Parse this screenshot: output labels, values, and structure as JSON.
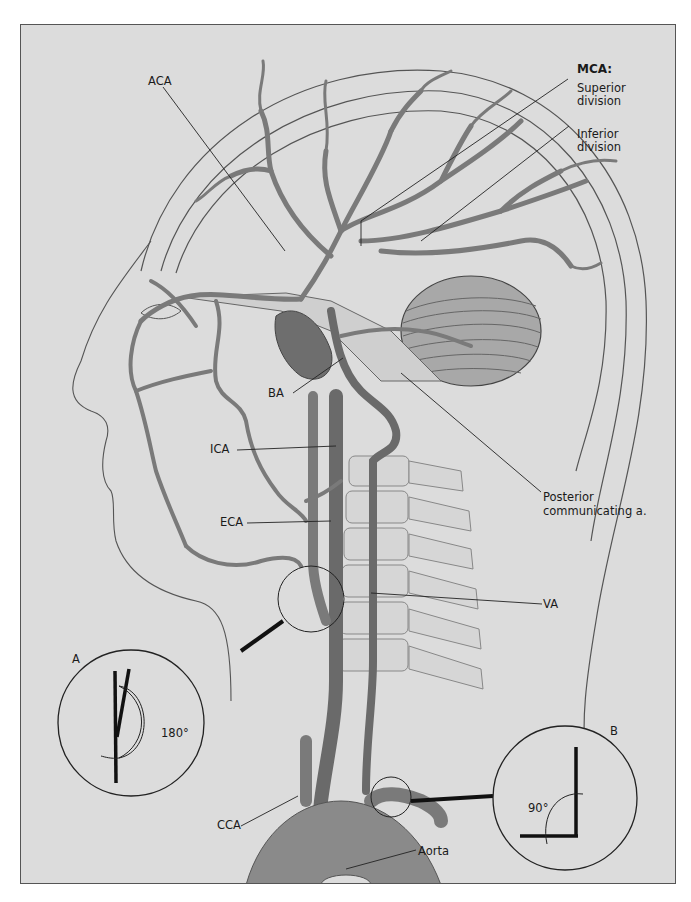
{
  "figure": {
    "colors": {
      "background": "#dcdcdc",
      "artery": "#8a8a8a",
      "artery_dark": "#5e5e5e",
      "outline": "#333333",
      "bone": "#d2d2d2"
    }
  },
  "labels": {
    "aca": "ACA",
    "mca_heading": "MCA:",
    "mca_superior": [
      "Superior",
      "division"
    ],
    "mca_inferior": [
      "Inferior",
      "division"
    ],
    "ba": "BA",
    "ica": "ICA",
    "eca": "ECA",
    "pcomm": [
      "Posterior",
      "communicating a."
    ],
    "va": "VA",
    "cca": "CCA",
    "aorta": "Aorta"
  },
  "insets": {
    "a": {
      "letter": "A",
      "angle": "180°"
    },
    "b": {
      "letter": "B",
      "angle": "90°"
    }
  }
}
